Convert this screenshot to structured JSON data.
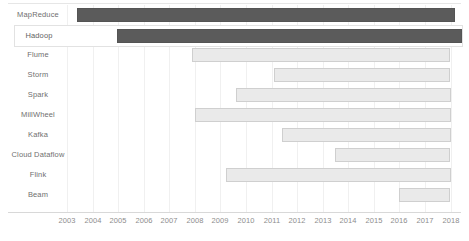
{
  "chart_data": {
    "type": "bar",
    "orientation": "horizontal",
    "subtype": "gantt-timeline",
    "title": "",
    "subtitle": "",
    "xlabel": "",
    "ylabel": "",
    "xlim": [
      2003,
      2018
    ],
    "grid": true,
    "legend": null,
    "legend_position": "none",
    "xticks": [
      2003,
      2004,
      2005,
      2006,
      2007,
      2008,
      2009,
      2010,
      2011,
      2012,
      2013,
      2014,
      2015,
      2016,
      2017,
      2018
    ],
    "xtick_labels": [
      "2003",
      "2004",
      "2005",
      "2006",
      "2007",
      "2008",
      "2009",
      "2010",
      "2011",
      "2012",
      "2013",
      "2014",
      "2015",
      "2016",
      "2017",
      "2018"
    ],
    "categories": [
      "MapReduce",
      "Hadoop",
      "Flume",
      "Storm",
      "Spark",
      "MillWheel",
      "Kafka",
      "Cloud Dataflow",
      "Flink",
      "Beam"
    ],
    "bars": [
      {
        "label": "MapReduce",
        "start": 2003.4,
        "end": 2018.2,
        "style": "dark",
        "highlighted": false
      },
      {
        "label": "Hadoop",
        "start": 2004.9,
        "end": 2018.4,
        "style": "dark",
        "highlighted": true
      },
      {
        "label": "Flume",
        "start": 2007.9,
        "end": 2018.0,
        "style": "light",
        "highlighted": false
      },
      {
        "label": "Storm",
        "start": 2011.1,
        "end": 2018.0,
        "style": "light",
        "highlighted": false
      },
      {
        "label": "Spark",
        "start": 2009.6,
        "end": 2018.0,
        "style": "light",
        "highlighted": false
      },
      {
        "label": "MillWheel",
        "start": 2008.0,
        "end": 2018.0,
        "style": "light",
        "highlighted": false
      },
      {
        "label": "Kafka",
        "start": 2011.4,
        "end": 2018.0,
        "style": "light",
        "highlighted": false
      },
      {
        "label": "Cloud Dataflow",
        "start": 2013.5,
        "end": 2018.0,
        "style": "light",
        "highlighted": false
      },
      {
        "label": "Flink",
        "start": 2009.2,
        "end": 2018.0,
        "style": "light",
        "highlighted": false
      },
      {
        "label": "Beam",
        "start": 2016.0,
        "end": 2018.0,
        "style": "light",
        "highlighted": false
      }
    ],
    "colors": {
      "bar_dark_fill": "#5b5b5b",
      "bar_dark_border": "#545454",
      "bar_light_fill": "#eaeaea",
      "bar_light_border": "#cfcfcf",
      "gridline": "#f0f0f0",
      "axis_line": "#d8d8d8",
      "label_text": "#6f6f6f",
      "tick_text": "#8d8d8d",
      "highlight_border": "#e2e2e2",
      "background": "#ffffff"
    }
  },
  "layout": {
    "plot_left_px": 76,
    "plot_right_px": 461,
    "x_origin_px": 67,
    "px_per_year": 25.57,
    "row_height_px": 20,
    "first_row_top_px": 5
  }
}
